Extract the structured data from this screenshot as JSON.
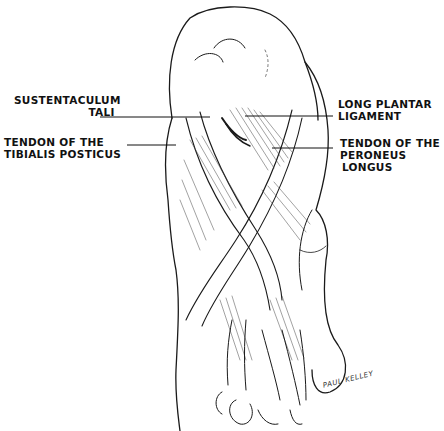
{
  "figure": {
    "labels": {
      "sustentaculum_tali": {
        "line1": "SUSTENTACULUM",
        "line2": "TALI"
      },
      "tibialis_posticus": {
        "line1": "TENDON OF THE",
        "line2": "TIBIALIS POSTICUS"
      },
      "long_plantar_ligament": {
        "line1": "LONG PLANTAR",
        "line2": "LIGAMENT"
      },
      "peroneus_longus": {
        "line1": "TENDON OF THE",
        "line2": "PERONEUS",
        "line3": "LONGUS"
      }
    },
    "signature": "PAUL KELLEY"
  },
  "colors": {
    "ink": "#1a1a1a",
    "background": "#ffffff"
  }
}
